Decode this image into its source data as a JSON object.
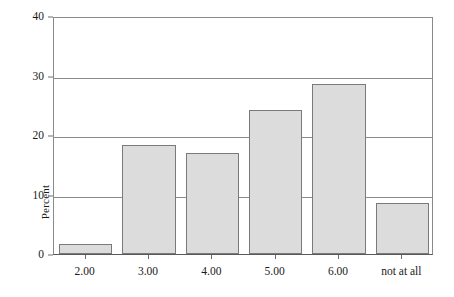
{
  "chart_data": {
    "type": "bar",
    "title": "",
    "subtitle": "",
    "xlabel": "",
    "ylabel": "Percent",
    "categories": [
      "2.00",
      "3.00",
      "4.00",
      "5.00",
      "6.00",
      "not at all"
    ],
    "values": [
      1.7,
      18.3,
      17.0,
      24.2,
      28.6,
      8.5
    ],
    "ylim": [
      0,
      40
    ],
    "yticks": [
      0,
      10,
      20,
      30,
      40
    ],
    "ytick_labels": [
      "0",
      "10",
      "20",
      "30",
      "40"
    ],
    "xlim": [
      0,
      6
    ],
    "grid": "horizontal",
    "legend": "none",
    "bar_fill": "#dcdcdc",
    "bar_edge": "#7a7a7a",
    "axis_color": "#8a8a8a"
  }
}
